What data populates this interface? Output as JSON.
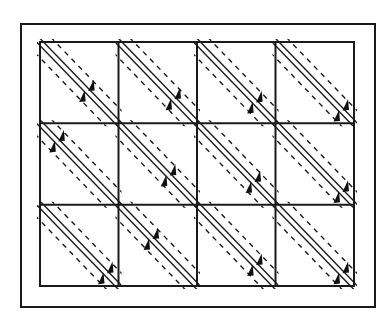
{
  "diagram": {
    "type": "grid-of-diagonal-lanes",
    "colors": {
      "background": "#ffffff",
      "stroke": "#1a1a1a",
      "arrow": "#111111"
    },
    "outer_frame": {
      "x": 21,
      "y": 24,
      "width": 354,
      "height": 283
    },
    "grid": {
      "x": 40,
      "y": 42,
      "width": 314,
      "height": 244,
      "columns": 4,
      "rows": 3
    },
    "cell_content": {
      "solid_lines": 2,
      "dashed_lines": 2,
      "arrowheads_per_cell": 2,
      "arrow_direction": "down-left"
    },
    "arrow_positions": [
      [
        0.62,
        0.72,
        0.76,
        0.86
      ],
      [
        0.24,
        0.66,
        0.74,
        0.86
      ],
      [
        0.86,
        0.44,
        0.76,
        0.86
      ]
    ]
  }
}
